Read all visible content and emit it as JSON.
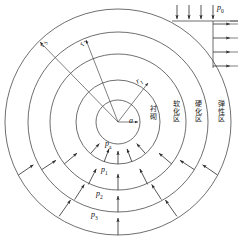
{
  "figure": {
    "type": "mechanics-diagram",
    "background": "#ffffff",
    "stroke_color": "#4a4a4a",
    "text_color": "#111111"
  },
  "geometry": {
    "center": {
      "x": 118,
      "y": 122
    },
    "circles": [
      {
        "name": "lining-inner-circle",
        "radius": 22
      },
      {
        "name": "lining-outer-circle",
        "radius": 42
      },
      {
        "name": "softening-zone-circle",
        "radius": 68
      },
      {
        "name": "hardening-zone-circle",
        "radius": 90
      },
      {
        "name": "elastic-zone-circle",
        "radius": 113
      }
    ]
  },
  "radii_labels": [
    {
      "name": "radius-a",
      "text": "a",
      "sub": "",
      "x": 139,
      "y": 117,
      "rotate": 0
    },
    {
      "name": "radius-r1",
      "text": "r",
      "sub": "1",
      "x": 136,
      "y": 79,
      "rotate": -28
    },
    {
      "name": "radius-r2",
      "text": "r",
      "sub": "2",
      "x": 78,
      "y": 46,
      "rotate": -74
    },
    {
      "name": "radius-r3",
      "text": "r",
      "sub": "3",
      "x": 38,
      "y": 47,
      "rotate": -74
    }
  ],
  "pressure_labels": [
    {
      "name": "pressure-pa",
      "text": "p",
      "sub": "a",
      "x": 102,
      "y": 143
    },
    {
      "name": "pressure-p1",
      "text": "p",
      "sub": "1",
      "x": 98,
      "y": 170
    },
    {
      "name": "pressure-p2",
      "text": "p",
      "sub": "2",
      "x": 92,
      "y": 194
    },
    {
      "name": "pressure-p3",
      "text": "p",
      "sub": "3",
      "x": 88,
      "y": 214
    },
    {
      "name": "pressure-p0",
      "text": "p",
      "sub": "0",
      "x": 216,
      "y": 5
    }
  ],
  "zone_labels": [
    {
      "name": "zone-lining",
      "text": "衬砌",
      "x": 150,
      "y": 108
    },
    {
      "name": "zone-softening",
      "text": "软化区",
      "x": 173,
      "y": 104
    },
    {
      "name": "zone-hardening",
      "text": "硬化区",
      "x": 195,
      "y": 104
    },
    {
      "name": "zone-elastic",
      "text": "弹性区",
      "x": 218,
      "y": 104
    }
  ],
  "far_field_load": {
    "name": "far-field-load-p0",
    "top_arrow_count": 4,
    "side_arrow_count": 4,
    "horizontal_line": {
      "x1": 172,
      "y1": 21,
      "x2": 238,
      "y2": 21
    },
    "vertical_line": {
      "x1": 213,
      "y1": 21,
      "x2": 213,
      "y2": 68
    }
  },
  "radial_arrow_rings": [
    {
      "name": "arrow-ring-pa",
      "count": 5,
      "outer_r": 42,
      "inner_r": 29,
      "angle_start": 228,
      "angle_end": 312
    },
    {
      "name": "arrow-ring-p1",
      "count": 5,
      "outer_r": 68,
      "inner_r": 52,
      "angle_start": 218,
      "angle_end": 322
    },
    {
      "name": "arrow-ring-p2",
      "count": 5,
      "outer_r": 90,
      "inner_r": 74,
      "angle_start": 212,
      "angle_end": 328
    },
    {
      "name": "arrow-ring-p3",
      "count": 5,
      "outer_r": 113,
      "inner_r": 96,
      "angle_start": 208,
      "angle_end": 332
    }
  ]
}
